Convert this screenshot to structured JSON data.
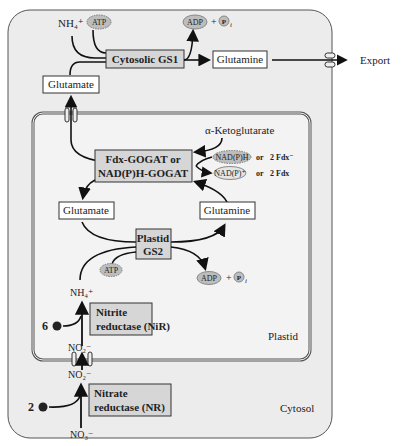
{
  "labels": {
    "nh4_top": "NH₄⁺",
    "atp_top": "ATP",
    "adp_top": "ADP",
    "plus": "+",
    "pi": "P",
    "pi_sub": "i",
    "gs1": "Cytosolic GS1",
    "glutamine_cyt": "Glutamine",
    "export": "Export",
    "glutamate_cyt": "Glutamate",
    "akg": "α-Ketoglutarate",
    "gogat1": "Fdx-GOGAT or",
    "gogat2": "NAD(P)H-GOGAT",
    "nadph": "NAD(P)H",
    "nadp": "NAD(P)⁺",
    "or": "or",
    "fdx_red": "2 Fdx⁻",
    "fdx_ox": "2 Fdx",
    "glutamate_pl": "Glutamate",
    "glutamine_pl": "Glutamine",
    "gs2_1": "Plastid",
    "gs2_2": "GS2",
    "atp_pl": "ATP",
    "adp_pl": "ADP",
    "nh4_pl": "NH₄⁺",
    "nir1": "Nitrite",
    "nir2": "reductase (NiR)",
    "six_e": "6",
    "e": "e",
    "no2_in": "NO₂⁻",
    "no2_out": "NO₂⁻",
    "nr1": "Nitrate",
    "nr2": "reductase (NR)",
    "two_e": "2",
    "no3": "NO₃⁻",
    "plastid": "Plastid",
    "cytosol": "Cytosol"
  },
  "colors": {
    "cytosol_bg": "#ececec",
    "plastid_bg": "#f2f2f2",
    "enzyme_box": "#d6d6d6",
    "molecule_box": "#ffffff",
    "cofactor": "#bdbdbd"
  }
}
